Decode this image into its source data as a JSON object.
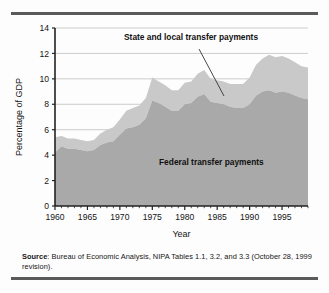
{
  "figure": {
    "source_label": "Source",
    "source_text": ": Bureau of Economic Analysis, NIPA Tables 1.1, 3.2, and 3.3 (October 28, 1999 revision)."
  },
  "colors": {
    "federal_band": "#a9a9a9",
    "state_local_band": "#c9c9c9",
    "axis": "#222222",
    "gridline": "#c0c0c0",
    "rule": "#5a5a5a",
    "text": "#151515"
  },
  "chart_data": {
    "type": "area",
    "stacked": true,
    "title": "",
    "xlabel": "Year",
    "ylabel": "Percentage of GDP",
    "xlim": [
      1960,
      1999
    ],
    "ylim": [
      0,
      14
    ],
    "ytick_step": 2,
    "yticks": [
      0,
      2,
      4,
      6,
      8,
      10,
      12,
      14
    ],
    "xticks": [
      1960,
      1965,
      1970,
      1975,
      1980,
      1985,
      1990,
      1995
    ],
    "xtick_minor_step": 1,
    "grid": "horizontal",
    "legend_position": "inline-annotations",
    "annotations": [
      {
        "name": "state-local-label",
        "text": "State and local transfer payments",
        "x_px": 113,
        "y_px": 22,
        "leader_from": [
          188,
          31
        ],
        "leader_to": [
          213,
          78
        ]
      },
      {
        "name": "federal-label",
        "text": "Federal transfer payments",
        "x_px": 148,
        "y_px": 147
      }
    ],
    "x": [
      1960,
      1961,
      1962,
      1963,
      1964,
      1965,
      1966,
      1967,
      1968,
      1969,
      1970,
      1971,
      1972,
      1973,
      1974,
      1975,
      1976,
      1977,
      1978,
      1979,
      1980,
      1981,
      1982,
      1983,
      1984,
      1985,
      1986,
      1987,
      1988,
      1989,
      1990,
      1991,
      1992,
      1993,
      1994,
      1995,
      1996,
      1997,
      1998,
      1999
    ],
    "series": [
      {
        "name": "Federal transfer payments",
        "color": "#a9a9a9",
        "values": [
          4.2,
          4.7,
          4.5,
          4.5,
          4.4,
          4.3,
          4.4,
          4.8,
          5.0,
          5.1,
          5.6,
          6.1,
          6.2,
          6.4,
          6.9,
          8.3,
          8.1,
          7.8,
          7.5,
          7.5,
          8.0,
          8.1,
          8.6,
          8.8,
          8.2,
          8.1,
          8.0,
          7.8,
          7.7,
          7.7,
          8.0,
          8.7,
          9.0,
          9.1,
          8.9,
          9.0,
          8.9,
          8.7,
          8.5,
          8.4
        ]
      },
      {
        "name": "State and local transfer payments",
        "color": "#c9c9c9",
        "values": [
          1.2,
          0.8,
          0.8,
          0.8,
          0.8,
          0.8,
          0.8,
          0.9,
          1.0,
          1.1,
          1.2,
          1.4,
          1.5,
          1.5,
          1.6,
          1.8,
          1.7,
          1.7,
          1.6,
          1.6,
          1.7,
          1.7,
          1.8,
          1.9,
          1.8,
          1.8,
          1.8,
          1.8,
          1.9,
          1.9,
          2.1,
          2.4,
          2.6,
          2.8,
          2.8,
          2.8,
          2.7,
          2.6,
          2.5,
          2.5
        ]
      }
    ],
    "totals": [
      5.4,
      5.5,
      5.3,
      5.3,
      5.2,
      5.1,
      5.2,
      5.7,
      6.0,
      6.2,
      6.8,
      7.5,
      7.7,
      7.9,
      8.5,
      10.1,
      9.8,
      9.5,
      9.1,
      9.1,
      9.7,
      9.8,
      10.4,
      10.7,
      10.0,
      9.9,
      9.8,
      9.6,
      9.6,
      9.6,
      10.1,
      11.1,
      11.6,
      11.9,
      11.7,
      11.8,
      11.6,
      11.3,
      11.0,
      10.9
    ]
  }
}
